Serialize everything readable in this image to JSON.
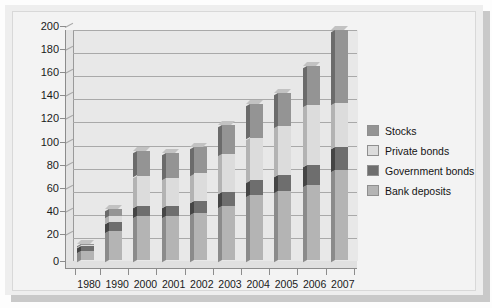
{
  "chart_data": {
    "type": "bar",
    "subtype": "stacked-column-3d",
    "title": "",
    "xlabel": "",
    "ylabel": "",
    "ylim": [
      0,
      200
    ],
    "ytick_step": 20,
    "yticks": [
      0,
      20,
      40,
      60,
      80,
      100,
      120,
      140,
      160,
      180,
      200
    ],
    "grid": true,
    "legend_position": "right",
    "categories": [
      "1980",
      "1990",
      "2000",
      "2001",
      "2002",
      "2003",
      "2004",
      "2005",
      "2006",
      "2007"
    ],
    "series": [
      {
        "name": "Bank deposits",
        "color": "#b4b4b4",
        "values": [
          8,
          25,
          38,
          38,
          41,
          47,
          56,
          60,
          65,
          78
        ]
      },
      {
        "name": "Government bonds",
        "color": "#6e6e6e",
        "values": [
          4,
          8,
          9,
          9,
          10,
          12,
          13,
          14,
          17,
          20
        ]
      },
      {
        "name": "Private bonds",
        "color": "#dcdcdc",
        "values": [
          1,
          5,
          26,
          24,
          24,
          33,
          37,
          42,
          52,
          38
        ]
      },
      {
        "name": "Stocks",
        "color": "#949494",
        "values": [
          1,
          6,
          21,
          22,
          23,
          25,
          29,
          29,
          34,
          63
        ]
      }
    ],
    "totals": [
      14,
      44,
      94,
      93,
      98,
      117,
      135,
      145,
      168,
      199
    ]
  },
  "legend": {
    "items": [
      {
        "label": "Stocks",
        "color": "#949494"
      },
      {
        "label": "Private bonds",
        "color": "#dcdcdc"
      },
      {
        "label": "Government bonds",
        "color": "#6e6e6e"
      },
      {
        "label": "Bank deposits",
        "color": "#b4b4b4"
      }
    ]
  },
  "colors": {
    "plot_background": "#e8e8e8",
    "card_background": "#f3f3f3",
    "plate_background": "#eeeeee",
    "axis": "#8c8c8c",
    "gridline": "#a9a9a9",
    "text": "#1a1a1a"
  }
}
